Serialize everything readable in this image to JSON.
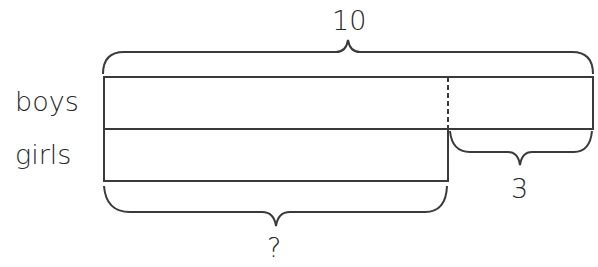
{
  "diagram": {
    "type": "bar-model",
    "rows": [
      {
        "label": "boys"
      },
      {
        "label": "girls"
      }
    ],
    "total_label": "10",
    "difference_label": "3",
    "unknown_label": "?"
  },
  "colors": {
    "stroke": "#3a3a3a",
    "text": "#2a2a2a",
    "background": "#ffffff"
  }
}
